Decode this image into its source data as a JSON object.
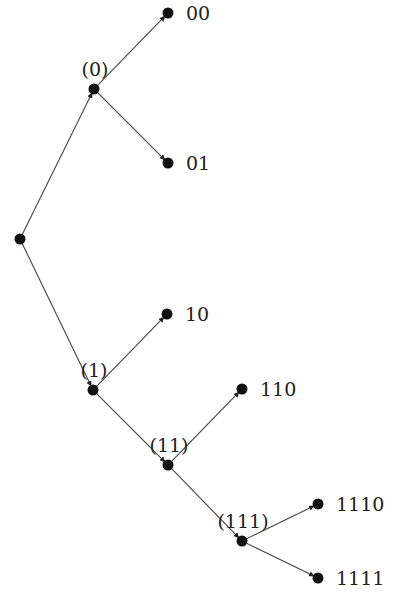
{
  "diagram": {
    "type": "binary-prefix-tree",
    "colors": {
      "node": "#111111",
      "edge": "#444444",
      "text": "#222222"
    },
    "nodes": [
      {
        "id": "root",
        "x": 20,
        "y": 239,
        "label": "",
        "label_pos": "none"
      },
      {
        "id": "n0",
        "x": 94,
        "y": 89,
        "label": "(0)",
        "label_pos": "above"
      },
      {
        "id": "n00",
        "x": 168,
        "y": 13,
        "label": "00",
        "label_pos": "right"
      },
      {
        "id": "n01",
        "x": 168,
        "y": 163,
        "label": "01",
        "label_pos": "right"
      },
      {
        "id": "n1",
        "x": 93,
        "y": 390,
        "label": "(1)",
        "label_pos": "above"
      },
      {
        "id": "n10",
        "x": 167,
        "y": 314,
        "label": "10",
        "label_pos": "right"
      },
      {
        "id": "n11",
        "x": 168,
        "y": 465,
        "label": "(11)",
        "label_pos": "above"
      },
      {
        "id": "n110",
        "x": 242,
        "y": 389,
        "label": "110",
        "label_pos": "right"
      },
      {
        "id": "n111",
        "x": 242,
        "y": 541,
        "label": "(111)",
        "label_pos": "above"
      },
      {
        "id": "n1110",
        "x": 318,
        "y": 504,
        "label": "1110",
        "label_pos": "right"
      },
      {
        "id": "n1111",
        "x": 318,
        "y": 578,
        "label": "1111",
        "label_pos": "right"
      }
    ],
    "edges": [
      {
        "from": "root",
        "to": "n0"
      },
      {
        "from": "n0",
        "to": "n00"
      },
      {
        "from": "n0",
        "to": "n01"
      },
      {
        "from": "root",
        "to": "n1"
      },
      {
        "from": "n1",
        "to": "n10"
      },
      {
        "from": "n1",
        "to": "n11"
      },
      {
        "from": "n11",
        "to": "n110"
      },
      {
        "from": "n11",
        "to": "n111"
      },
      {
        "from": "n111",
        "to": "n1110"
      },
      {
        "from": "n111",
        "to": "n1111"
      }
    ]
  }
}
